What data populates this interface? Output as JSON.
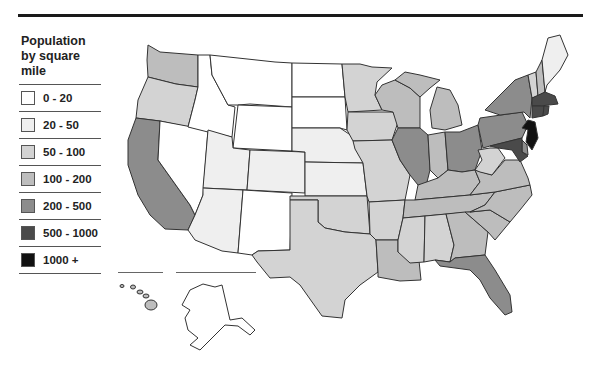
{
  "legend": {
    "title": "Population by square mile",
    "title_lines": [
      "Population",
      "by square",
      "mile"
    ],
    "items": [
      {
        "label": "0 - 20",
        "color": "#ffffff"
      },
      {
        "label": "20 - 50",
        "color": "#efefef"
      },
      {
        "label": "50 - 100",
        "color": "#d3d3d3"
      },
      {
        "label": "100 - 200",
        "color": "#bdbdbd"
      },
      {
        "label": "200 - 500",
        "color": "#8c8c8c"
      },
      {
        "label": "500 - 1000",
        "color": "#4a4a4a"
      },
      {
        "label": "1000 +",
        "color": "#111111"
      }
    ]
  },
  "map": {
    "subject": "United States population density by state",
    "states": {
      "WA": "100 - 200",
      "OR": "50 - 100",
      "CA": "200 - 500",
      "ID": "0 - 20",
      "NV": "0 - 20",
      "MT": "0 - 20",
      "WY": "0 - 20",
      "UT": "20 - 50",
      "AZ": "20 - 50",
      "CO": "20 - 50",
      "NM": "0 - 20",
      "ND": "0 - 20",
      "SD": "0 - 20",
      "NE": "20 - 50",
      "KS": "20 - 50",
      "OK": "50 - 100",
      "TX": "50 - 100",
      "MN": "50 - 100",
      "IA": "50 - 100",
      "MO": "50 - 100",
      "AR": "50 - 100",
      "LA": "100 - 200",
      "WI": "100 - 200",
      "IL": "200 - 500",
      "MI": "100 - 200",
      "IN": "100 - 200",
      "OH": "200 - 500",
      "KY": "100 - 200",
      "TN": "100 - 200",
      "MS": "50 - 100",
      "AL": "50 - 100",
      "GA": "100 - 200",
      "FL": "200 - 500",
      "SC": "100 - 200",
      "NC": "100 - 200",
      "VA": "100 - 200",
      "WV": "50 - 100",
      "PA": "200 - 500",
      "NY": "200 - 500",
      "VT": "50 - 100",
      "NH": "100 - 200",
      "ME": "20 - 50",
      "MA": "500 - 1000",
      "RI": "500 - 1000",
      "CT": "500 - 1000",
      "NJ": "1000 +",
      "DE": "200 - 500",
      "MD": "500 - 1000",
      "AK": "0 - 20",
      "HI": "100 - 200"
    }
  }
}
